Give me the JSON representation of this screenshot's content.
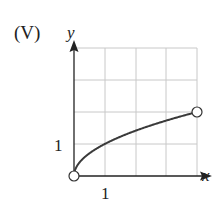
{
  "figure": {
    "label": "(V)",
    "y_axis_label": "y",
    "x_axis_label": "x",
    "x_tick_label": "1",
    "y_tick_label": "1"
  },
  "colors": {
    "grid": "#c8c8c8",
    "axis": "#222222",
    "curve": "#3a3a3a",
    "open_point_fill": "#ffffff"
  },
  "chart_data": {
    "type": "line",
    "title": "(V)",
    "xlabel": "x",
    "ylabel": "y",
    "function": "y = sqrt(x)",
    "x": [
      0,
      0.25,
      0.5,
      1,
      1.5,
      2,
      2.5,
      3,
      3.5,
      4
    ],
    "values": [
      0,
      0.5,
      0.707,
      1,
      1.225,
      1.414,
      1.581,
      1.732,
      1.871,
      2
    ],
    "endpoints": [
      {
        "x": 0,
        "y": 0,
        "style": "open"
      },
      {
        "x": 4,
        "y": 2,
        "style": "open"
      }
    ],
    "xlim": [
      0,
      4
    ],
    "ylim": [
      0,
      4
    ],
    "x_ticks_labeled": [
      1
    ],
    "y_ticks_labeled": [
      1
    ],
    "grid": true,
    "grid_spacing": 1,
    "legend": null
  }
}
